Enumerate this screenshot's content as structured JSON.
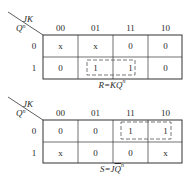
{
  "maps": [
    {
      "id": "R",
      "col_var": "JK",
      "row_var": "Q",
      "row_var_sup": "n",
      "columns": [
        "00",
        "01",
        "11",
        "10"
      ],
      "rows": [
        {
          "label": "0",
          "cells": [
            "x",
            "x",
            "0",
            "0"
          ]
        },
        {
          "label": "1",
          "cells": [
            "0",
            "1",
            "1",
            "0"
          ]
        }
      ],
      "group": {
        "row": 1,
        "col_start": 1,
        "col_end": 2
      },
      "caption": {
        "lhs": "R",
        "eq": "=",
        "term": "KQ",
        "sup": "n",
        "overline": false
      }
    },
    {
      "id": "S",
      "col_var": "JK",
      "row_var": "Q",
      "row_var_sup": "n",
      "columns": [
        "00",
        "01",
        "11",
        "10"
      ],
      "rows": [
        {
          "label": "0",
          "cells": [
            "0",
            "0",
            "1",
            "1"
          ]
        },
        {
          "label": "1",
          "cells": [
            "x",
            "0",
            "0",
            "x"
          ]
        }
      ],
      "group": {
        "row": 0,
        "col_start": 2,
        "col_end": 3
      },
      "caption": {
        "lhs": "S",
        "eq": "=",
        "term_plain": "J",
        "term_over": "Q",
        "sup": "n",
        "overline": true
      }
    }
  ]
}
